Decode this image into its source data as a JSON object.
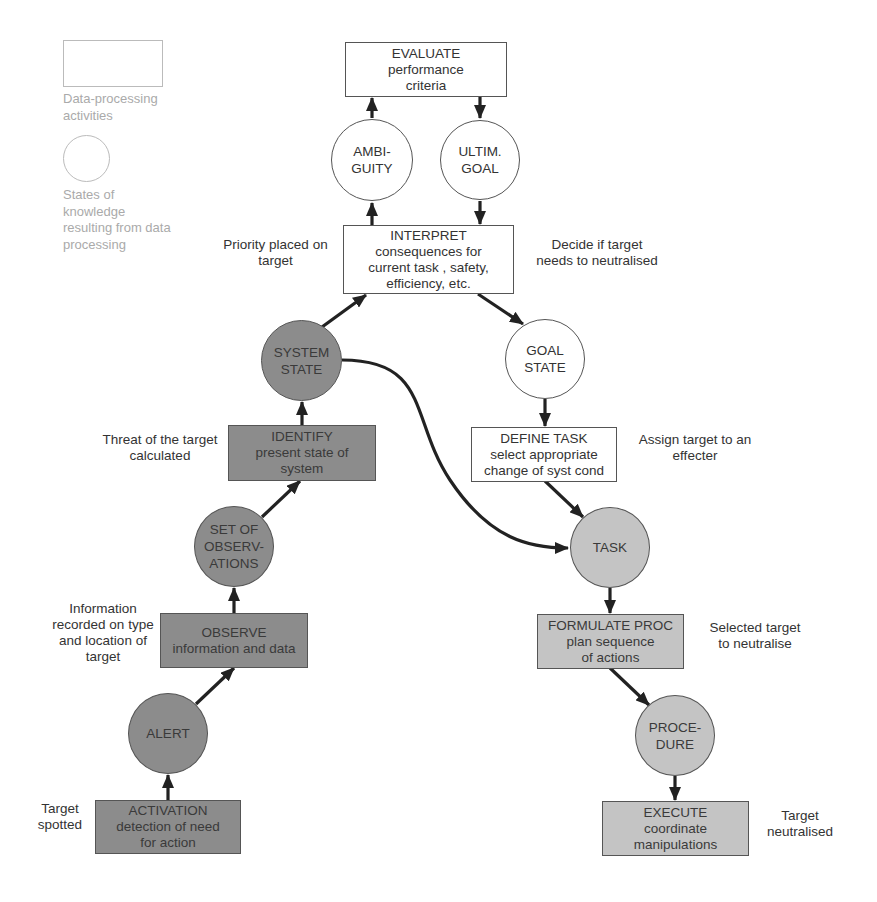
{
  "legend": {
    "activity_label": [
      "Data-processing",
      "activities"
    ],
    "state_label": [
      "States of",
      "knowledge",
      "resulting from data",
      "processing"
    ]
  },
  "colors": {
    "white_fill": "#ffffff",
    "dark_fill": "#8c8c8c",
    "light_fill": "#c4c4c4",
    "stroke": "#333333",
    "legend_text": "#aaaaaa"
  },
  "activities": {
    "evaluate": {
      "title": "EVALUATE",
      "lines": [
        "performance",
        "criteria"
      ]
    },
    "interpret": {
      "title": "INTERPRET",
      "lines": [
        "consequences for",
        "current task , safety,",
        "efficiency, etc."
      ]
    },
    "identify": {
      "title": "IDENTIFY",
      "lines": [
        "present state of",
        "system"
      ]
    },
    "define_task": {
      "title": "DEFINE TASK",
      "lines": [
        "select appropriate",
        "change of syst cond"
      ]
    },
    "observe": {
      "title": "OBSERVE",
      "lines": [
        "information and data"
      ]
    },
    "formulate_proc": {
      "title": "FORMULATE PROC",
      "lines": [
        "plan sequence",
        "of actions"
      ]
    },
    "activation": {
      "title": "ACTIVATION",
      "lines": [
        "detection of need",
        "for action"
      ]
    },
    "execute": {
      "title": "EXECUTE",
      "lines": [
        "coordinate",
        "manipulations"
      ]
    }
  },
  "states": {
    "ambiguity": [
      "AMBI-",
      "GUITY"
    ],
    "ultim_goal": [
      "ULTIM.",
      "GOAL"
    ],
    "system_state": [
      "SYSTEM",
      "STATE"
    ],
    "goal_state": [
      "GOAL",
      "STATE"
    ],
    "set_of_observations": [
      "SET OF",
      "OBSERV-",
      "ATIONS"
    ],
    "task": [
      "TASK"
    ],
    "alert": [
      "ALERT"
    ],
    "procedure": [
      "PROCE-",
      "DURE"
    ]
  },
  "annotations": {
    "priority": [
      "Priority placed on",
      "target"
    ],
    "decide": [
      "Decide if target",
      "needs to neutralised"
    ],
    "threat": [
      "Threat of the target",
      "calculated"
    ],
    "assign": [
      "Assign target to an",
      "effecter"
    ],
    "information": [
      "Information",
      "recorded on type",
      "and location of",
      "target"
    ],
    "selected": [
      "Selected target",
      "to neutralise"
    ],
    "spotted": [
      "Target",
      "spotted"
    ],
    "neutralised": [
      "Target",
      "neutralised"
    ]
  }
}
